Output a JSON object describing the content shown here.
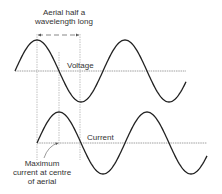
{
  "labels": {
    "aerial_line1": "Aerial half a",
    "aerial_line2": "wavelength long",
    "voltage": "Voltage",
    "current": "Current",
    "max_line1": "Maximum",
    "max_line2": "current at centre",
    "max_line3": "of aerial"
  },
  "colors": {
    "wave": "#222222",
    "axis": "#888888",
    "guide": "#999999"
  }
}
